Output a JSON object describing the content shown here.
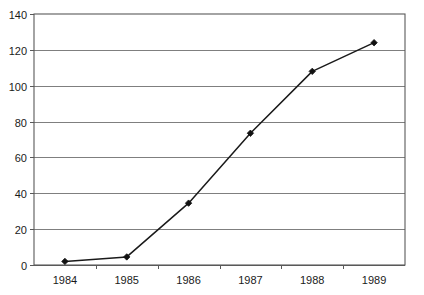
{
  "chart_data": {
    "type": "line",
    "title": "",
    "subtitle": "",
    "xlabel": "",
    "ylabel": "",
    "categories": [
      "1984",
      "1985",
      "1986",
      "1987",
      "1988",
      "1989"
    ],
    "values": [
      2,
      4.5,
      34.5,
      73.5,
      108,
      124
    ],
    "series": [
      {
        "name": "",
        "values": [
          2,
          4.5,
          34.5,
          73.5,
          108,
          124
        ]
      }
    ],
    "ylim": [
      0,
      140
    ],
    "ytick_values": [
      0,
      20,
      40,
      60,
      80,
      100,
      120,
      140
    ],
    "ytick_labels": [
      "0",
      "20",
      "40",
      "60",
      "80",
      "100",
      "120",
      "140"
    ],
    "xtick_labels": [
      "1984",
      "1985",
      "1986",
      "1987",
      "1988",
      "1989"
    ],
    "grid": {
      "horizontal": true,
      "vertical": false
    },
    "legend": {
      "visible": false,
      "position": "none",
      "entries": []
    },
    "annotations": [],
    "marker": "diamond",
    "colors": {
      "line": "#1a1a1a",
      "marker": "#111111",
      "gridline": "#7f7f7f",
      "frame": "#595959",
      "plot_background": "#ffffff",
      "text": "#1a1a1a"
    }
  }
}
